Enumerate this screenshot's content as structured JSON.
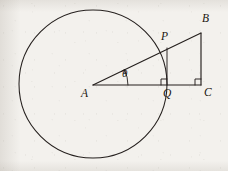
{
  "figure": {
    "background_color": "#f3f1ed",
    "ink_color": "#241f1d",
    "labels": {
      "A": "A",
      "B": "B",
      "C": "C",
      "P": "P",
      "Q": "Q",
      "theta": "θ"
    }
  },
  "geometry": {
    "circle": {
      "cx": 93,
      "cy": 84,
      "r": 74,
      "stroke_width": 1.05
    },
    "points": {
      "A": {
        "x": 93,
        "y": 85
      },
      "B": {
        "x": 201,
        "y": 33
      },
      "C": {
        "x": 201,
        "y": 85
      },
      "P": {
        "x": 167,
        "y": 48
      },
      "Q": {
        "x": 167,
        "y": 85
      }
    },
    "segments": [
      {
        "name": "AB",
        "from": "A",
        "to": "B"
      },
      {
        "name": "AC",
        "from": "A",
        "to": "C"
      },
      {
        "name": "BC",
        "from": "B",
        "to": "C"
      },
      {
        "name": "PQ",
        "from": "P",
        "to": "Q"
      }
    ],
    "right_angle_marks": [
      {
        "at": "Q",
        "size": 6
      },
      {
        "at": "C",
        "size": 6
      }
    ],
    "angle_arc": {
      "vertex": "A",
      "label": "θ",
      "radius": 35,
      "from_deg": 0,
      "to_deg": 25.7,
      "arrowhead": true
    }
  },
  "label_positions": {
    "A": {
      "x": 81,
      "y": 88
    },
    "B": {
      "x": 202,
      "y": 13
    },
    "C": {
      "x": 204,
      "y": 87
    },
    "P": {
      "x": 161,
      "y": 31
    },
    "Q": {
      "x": 163,
      "y": 88
    },
    "theta": {
      "x": 122,
      "y": 68
    }
  }
}
